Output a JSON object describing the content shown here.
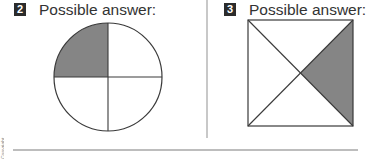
{
  "problems": [
    {
      "number": "2",
      "heading": "Possible answer:",
      "figure": {
        "shape": "circle",
        "divisions": 4,
        "shaded_parts": [
          "top-left quarter"
        ],
        "center": [
          108,
          77
        ],
        "radius": 54
      }
    },
    {
      "number": "3",
      "heading": "Possible answer:",
      "figure": {
        "shape": "square",
        "divisions": 4,
        "division_type": "diagonals",
        "shaded_parts": [
          "right triangle"
        ],
        "bounds": [
          248,
          20,
          353,
          126
        ]
      }
    }
  ],
  "colors": {
    "shade": "#858585",
    "line": "#3a3a3a",
    "badge_bg": "#2b2b2b",
    "divider": "#c8c8c8"
  },
  "spine_text": "Copyright"
}
